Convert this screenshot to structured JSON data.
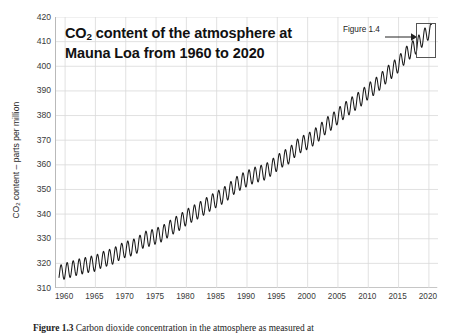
{
  "figure": {
    "title_line1_pre": "CO",
    "title_line1_sub": "2",
    "title_line1_post": " content of the atmosphere at",
    "title_line2": "Mauna Loa from 1960 to 2020",
    "caption_label": "Figure 1.3",
    "caption_text": " Carbon dioxide concentration in the atmosphere as measured at",
    "annotation_label": "Figure 1.4",
    "annotation_icon": "right-arrow-icon",
    "background_color": "#ffffff",
    "line_color": "#1a1a1a",
    "grid_color": "#d9d9d9",
    "axis_color": "#b9b9b9"
  },
  "chart_data": {
    "type": "line",
    "title": "CO2 content of the atmosphere at Mauna Loa from 1960 to 2020",
    "xlabel": "",
    "ylabel": "CO2 content – parts per million",
    "ylabel_pre": "CO",
    "ylabel_sub": "2",
    "ylabel_post": " content – parts per million",
    "xlim": [
      1958.5,
      2021.5
    ],
    "ylim": [
      310,
      420
    ],
    "xticks": [
      1960,
      1965,
      1970,
      1975,
      1980,
      1985,
      1990,
      1995,
      2000,
      2005,
      2010,
      2015,
      2020
    ],
    "yticks": [
      310,
      320,
      330,
      340,
      350,
      360,
      370,
      380,
      390,
      400,
      410,
      420
    ],
    "grid": true,
    "legend": false,
    "seasonal_amplitude_ppm": 3.2,
    "seasonal_peak_month": 5,
    "series": [
      {
        "name": "Mauna Loa annual mean CO2",
        "x": [
          1959,
          1960,
          1961,
          1962,
          1963,
          1964,
          1965,
          1966,
          1967,
          1968,
          1969,
          1970,
          1971,
          1972,
          1973,
          1974,
          1975,
          1976,
          1977,
          1978,
          1979,
          1980,
          1981,
          1982,
          1983,
          1984,
          1985,
          1986,
          1987,
          1988,
          1989,
          1990,
          1991,
          1992,
          1993,
          1994,
          1995,
          1996,
          1997,
          1998,
          1999,
          2000,
          2001,
          2002,
          2003,
          2004,
          2005,
          2006,
          2007,
          2008,
          2009,
          2010,
          2011,
          2012,
          2013,
          2014,
          2015,
          2016,
          2017,
          2018,
          2019,
          2020
        ],
        "values": [
          315.9,
          316.9,
          317.6,
          318.4,
          319.0,
          319.6,
          320.0,
          321.4,
          322.2,
          323.0,
          324.6,
          325.7,
          326.3,
          327.5,
          329.7,
          330.2,
          331.1,
          332.0,
          333.8,
          335.4,
          336.8,
          338.7,
          340.1,
          341.4,
          343.0,
          344.6,
          346.0,
          347.4,
          349.2,
          351.6,
          353.1,
          354.4,
          355.6,
          356.4,
          357.1,
          358.8,
          360.8,
          362.6,
          363.7,
          366.7,
          368.4,
          369.5,
          371.1,
          373.2,
          375.8,
          377.5,
          379.8,
          381.9,
          383.8,
          385.6,
          387.4,
          389.9,
          391.6,
          393.8,
          396.5,
          398.6,
          400.8,
          404.2,
          406.5,
          408.5,
          411.4,
          414.2
        ]
      }
    ]
  }
}
